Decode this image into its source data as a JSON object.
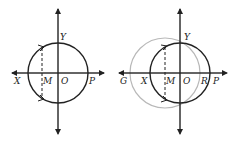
{
  "colors": {
    "ink": "#222222",
    "gray_circle": "#b8b8b8",
    "background": "#ffffff"
  },
  "left_panel": {
    "labels": {
      "x": "X",
      "m": "M",
      "o": "O",
      "p": "P",
      "y": "Y"
    },
    "circle": {
      "cx": 58,
      "cy": 73,
      "r": 30
    }
  },
  "right_panel": {
    "labels": {
      "g": "G",
      "x": "X",
      "m": "M",
      "o": "O",
      "r": "R",
      "p": "P",
      "y": "Y"
    },
    "black_circle": {
      "cx": 180,
      "cy": 73,
      "r": 30
    },
    "gray_circle": {
      "cx": 165,
      "cy": 73,
      "r": 35
    }
  }
}
